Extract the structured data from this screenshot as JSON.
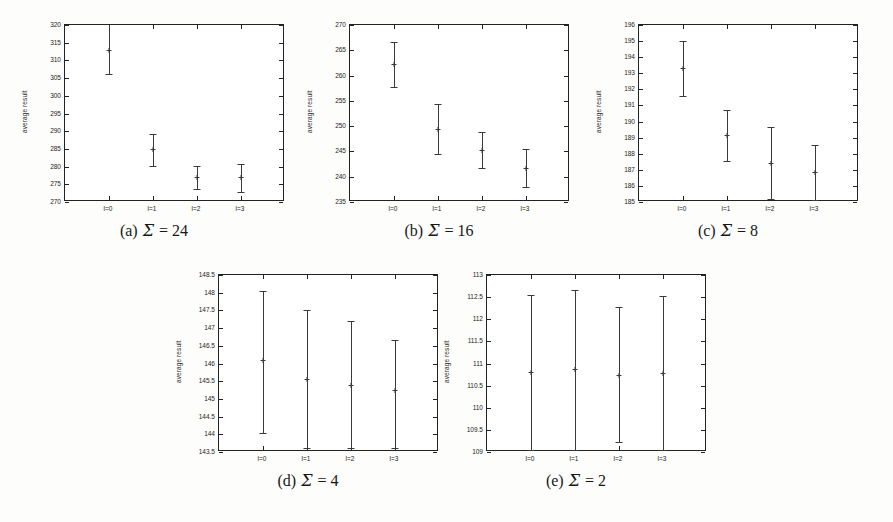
{
  "figure": {
    "ylabel": "average result",
    "xtick_labels": [
      "l=0",
      "l=1",
      "l=2",
      "l=3"
    ],
    "caption_symbol": "Σ",
    "line_color": "#3a3a3a",
    "frame_color": "#222222",
    "background": "#fdfdfc"
  },
  "chart_data": [
    {
      "type": "scatter",
      "id": "panel-a",
      "title": "(a) Σ = 24",
      "caption_index": "(a)",
      "caption_value": "24",
      "xlabel": "",
      "ylabel": "average result",
      "categories": [
        "l=0",
        "l=1",
        "l=2",
        "l=3"
      ],
      "values": [
        313.0,
        285.0,
        277.0,
        277.0
      ],
      "err_low": [
        306.2,
        280.3,
        273.8,
        272.8
      ],
      "err_high": [
        320.5,
        289.3,
        280.1,
        280.6
      ],
      "ylim": [
        270,
        320
      ],
      "ytick_labels": [
        "270",
        "275",
        "280",
        "285",
        "290",
        "295",
        "300",
        "305",
        "310",
        "315",
        "320"
      ],
      "ytick_values": [
        270,
        275,
        280,
        285,
        290,
        295,
        300,
        305,
        310,
        315,
        320
      ],
      "grid": false,
      "legend": "none"
    },
    {
      "type": "scatter",
      "id": "panel-b",
      "title": "(b) Σ = 16",
      "caption_index": "(b)",
      "caption_value": "16",
      "xlabel": "",
      "ylabel": "average result",
      "categories": [
        "l=0",
        "l=1",
        "l=2",
        "l=3"
      ],
      "values": [
        262.2,
        249.4,
        245.2,
        241.7
      ],
      "err_low": [
        257.8,
        244.4,
        241.8,
        238.0
      ],
      "err_high": [
        266.7,
        254.4,
        248.8,
        245.4
      ],
      "ylim": [
        235,
        270
      ],
      "ytick_labels": [
        "235",
        "240",
        "245",
        "250",
        "255",
        "260",
        "265",
        "270"
      ],
      "ytick_values": [
        235,
        240,
        245,
        250,
        255,
        260,
        265,
        270
      ],
      "grid": false,
      "legend": "none"
    },
    {
      "type": "scatter",
      "id": "panel-c",
      "title": "(c) Σ = 8",
      "caption_index": "(c)",
      "caption_value": "8",
      "xlabel": "",
      "ylabel": "average result",
      "categories": [
        "l=0",
        "l=1",
        "l=2",
        "l=3"
      ],
      "values": [
        193.3,
        189.15,
        187.45,
        186.85
      ],
      "err_low": [
        191.6,
        187.55,
        185.2,
        185.1
      ],
      "err_high": [
        195.0,
        190.7,
        189.65,
        188.55
      ],
      "ylim": [
        185,
        196
      ],
      "ytick_labels": [
        "185",
        "186",
        "187",
        "188",
        "189",
        "190",
        "191",
        "192",
        "193",
        "194",
        "195",
        "196"
      ],
      "ytick_values": [
        185,
        186,
        187,
        188,
        189,
        190,
        191,
        192,
        193,
        194,
        195,
        196
      ],
      "grid": false,
      "legend": "none"
    },
    {
      "type": "scatter",
      "id": "panel-d",
      "title": "(d) Σ = 4",
      "caption_index": "(d)",
      "caption_value": "4",
      "xlabel": "",
      "ylabel": "average result",
      "categories": [
        "l=0",
        "l=1",
        "l=2",
        "l=3"
      ],
      "values": [
        146.1,
        145.55,
        145.4,
        145.25
      ],
      "err_low": [
        144.05,
        143.6,
        143.6,
        143.6
      ],
      "err_high": [
        148.05,
        147.5,
        147.2,
        146.65
      ],
      "ylim": [
        143.5,
        148.5
      ],
      "ytick_labels": [
        "143.5",
        "144",
        "144.5",
        "145",
        "145.5",
        "146",
        "146.5",
        "147",
        "147.5",
        "148",
        "148.5"
      ],
      "ytick_values": [
        143.5,
        144,
        144.5,
        145,
        145.5,
        146,
        146.5,
        147,
        147.5,
        148,
        148.5
      ],
      "grid": false,
      "legend": "none"
    },
    {
      "type": "scatter",
      "id": "panel-e",
      "title": "(e) Σ = 2",
      "caption_index": "(e)",
      "caption_value": "2",
      "xlabel": "",
      "ylabel": "average result",
      "categories": [
        "l=0",
        "l=1",
        "l=2",
        "l=3"
      ],
      "values": [
        110.8,
        110.87,
        110.75,
        110.78
      ],
      "err_low": [
        109.05,
        109.05,
        109.22,
        109.05
      ],
      "err_high": [
        112.55,
        112.65,
        112.27,
        112.52
      ],
      "ylim": [
        109,
        113
      ],
      "ytick_labels": [
        "109",
        "109.5",
        "110",
        "110.5",
        "111",
        "111.5",
        "112",
        "112.5",
        "113"
      ],
      "ytick_values": [
        109,
        109.5,
        110,
        110.5,
        111,
        111.5,
        112,
        112.5,
        113
      ],
      "grid": false,
      "legend": "none"
    }
  ],
  "panel_layout": [
    {
      "id": "panel-a",
      "left": 18,
      "top": 18,
      "width": 272,
      "height": 225
    },
    {
      "id": "panel-b",
      "left": 303,
      "top": 18,
      "width": 272,
      "height": 225
    },
    {
      "id": "panel-c",
      "left": 592,
      "top": 18,
      "width": 272,
      "height": 225
    },
    {
      "id": "panel-d",
      "left": 172,
      "top": 268,
      "width": 272,
      "height": 225
    },
    {
      "id": "panel-e",
      "left": 440,
      "top": 268,
      "width": 272,
      "height": 225
    }
  ]
}
